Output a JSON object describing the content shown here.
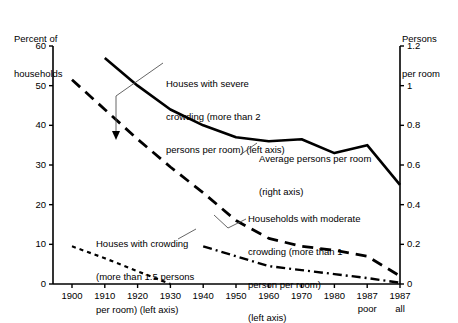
{
  "chart_data": {
    "type": "line",
    "title": "",
    "subtitle": "",
    "xlabel": "",
    "ylabel": "Percent of households",
    "y2label": "Persons per room",
    "grid": false,
    "legend_position": "inline-annotations",
    "x": [
      "1900",
      "1910",
      "1920",
      "1930",
      "1940",
      "1950",
      "1960",
      "1970",
      "1980",
      "1987 poor",
      "1987 all"
    ],
    "xtick_labels": [
      "1900",
      "1910",
      "1920",
      "1930",
      "1940",
      "1950",
      "1960",
      "1970",
      "1980",
      "1987",
      "1987"
    ],
    "xtick_sublabels": [
      "",
      "",
      "",
      "",
      "",
      "",
      "",
      "",
      "",
      "poor",
      "all"
    ],
    "ylim": [
      0,
      60
    ],
    "ytick_labels": [
      "0",
      "10",
      "20",
      "30",
      "40",
      "50",
      "60"
    ],
    "yticks": [
      0,
      10,
      20,
      30,
      40,
      50,
      60
    ],
    "y2lim": [
      0,
      1.2
    ],
    "y2tick_labels": [
      "0",
      "0.2",
      "0.4",
      "0.6",
      "0.8",
      "1",
      "1.2"
    ],
    "y2ticks": [
      0,
      0.2,
      0.4,
      0.6,
      0.8,
      1.0,
      1.2
    ],
    "series": [
      {
        "name": "Average persons per room (right axis)",
        "axis": "right",
        "style": "solid",
        "x": [
          "1910",
          "1920",
          "1930",
          "1940",
          "1950",
          "1960",
          "1970",
          "1980",
          "1987 poor",
          "1987 all"
        ],
        "values": [
          1.14,
          1.0,
          0.88,
          0.8,
          0.74,
          0.72,
          0.73,
          0.66,
          0.7,
          0.5
        ]
      },
      {
        "name": "Houses with severe crowding (more than 2 persons per room) (left axis)",
        "axis": "left",
        "style": "dashed",
        "x": [
          "1900",
          "1910",
          "1920",
          "1930",
          "1940",
          "1950",
          "1960",
          "1970",
          "1980",
          "1987 poor",
          "1987 all"
        ],
        "values": [
          51.5,
          44.0,
          36.5,
          29.5,
          23.0,
          16.0,
          11.5,
          9.5,
          8.5,
          7.0,
          2.0
        ]
      },
      {
        "name": "Households with moderate crowding (more than 1 person per room) (left axis)",
        "axis": "left",
        "style": "dash-dot",
        "x": [
          "1940",
          "1950",
          "1960",
          "1970",
          "1980",
          "1987 poor",
          "1987 all"
        ],
        "values": [
          9.5,
          7.0,
          4.5,
          3.5,
          2.5,
          1.5,
          0.3
        ]
      },
      {
        "name": "Houses with crowding (more than 1.5 persons per room) (left axis)",
        "axis": "left",
        "style": "dotted",
        "x": [
          "1900",
          "1910",
          "1920",
          "1930"
        ],
        "values": [
          9.5,
          6.5,
          3.2,
          0.0
        ]
      }
    ],
    "annotations": [
      {
        "id": "severe",
        "text": "Houses with severe\ncrowding (more than 2\npersons per room) (left axis)"
      },
      {
        "id": "average",
        "text": "Average persons per room\n(right axis)"
      },
      {
        "id": "moderate",
        "text": "Households with moderate\ncrowding (more than 1\nperson per room)\n(left axis)"
      },
      {
        "id": "crowding",
        "text": "Houses with crowding\n(more than 1.5 persons\nper room) (left axis)"
      }
    ]
  },
  "axes": {
    "left_title_line1": "Percent of",
    "left_title_line2": "households",
    "right_title_line1": "Persons",
    "right_title_line2": "per room"
  },
  "annotations": {
    "severe_l1": "Houses with severe",
    "severe_l2": "crowding (more than 2",
    "severe_l3": "persons per room) (left axis)",
    "average_l1": "Average persons per room",
    "average_l2": "(right axis)",
    "moderate_l1": "Households with moderate",
    "moderate_l2": "crowding (more than 1",
    "moderate_l3": "person per room)",
    "moderate_l4": "(left axis)",
    "crowding_l1": "Houses with crowding",
    "crowding_l2": "(more than 1.5 persons",
    "crowding_l3": "per room) (left axis)"
  },
  "colors": {
    "ink": "#000000",
    "background": "#ffffff",
    "leader": "#555555"
  }
}
